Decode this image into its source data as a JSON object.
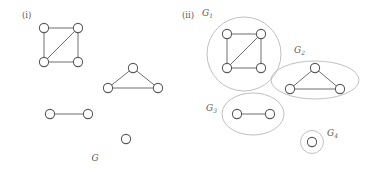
{
  "figure": {
    "caption_left": "G",
    "panels": [
      {
        "id": "panel-i",
        "label": "(i)"
      },
      {
        "id": "panel-ii",
        "label": "(ii)"
      }
    ],
    "component_labels": {
      "g1_base": "G",
      "g1_sub": "1",
      "g2_base": "G",
      "g2_sub": "2",
      "g3_base": "G",
      "g3_sub": "3",
      "g4_base": "G",
      "g4_sub": "4"
    },
    "colors": {
      "node_fill": "#ffffff",
      "node_stroke": "#5a5a5a",
      "edge_stroke": "#6f6f6f",
      "enclosure_stroke": "#b9b9b9",
      "text": "#5a5a5a",
      "background": "#ffffff"
    }
  },
  "graph_left": {
    "name": "G",
    "components": [
      {
        "name": "square-with-diagonal",
        "vertices": [
          {
            "id": "a1",
            "cx": 44,
            "cy": 28,
            "r": 4.6
          },
          {
            "id": "a2",
            "cx": 78,
            "cy": 28,
            "r": 4.6
          },
          {
            "id": "a3",
            "cx": 44,
            "cy": 62,
            "r": 4.6
          },
          {
            "id": "a4",
            "cx": 78,
            "cy": 62,
            "r": 4.6
          }
        ],
        "edges": [
          [
            "a1",
            "a2"
          ],
          [
            "a1",
            "a3"
          ],
          [
            "a2",
            "a4"
          ],
          [
            "a3",
            "a4"
          ],
          [
            "a3",
            "a2"
          ]
        ]
      },
      {
        "name": "triangle",
        "vertices": [
          {
            "id": "b1",
            "cx": 133,
            "cy": 68,
            "r": 4.6
          },
          {
            "id": "b2",
            "cx": 108,
            "cy": 88,
            "r": 4.6
          },
          {
            "id": "b3",
            "cx": 158,
            "cy": 88,
            "r": 4.6
          }
        ],
        "edges": [
          [
            "b1",
            "b2"
          ],
          [
            "b1",
            "b3"
          ],
          [
            "b2",
            "b3"
          ]
        ]
      },
      {
        "name": "single-edge",
        "vertices": [
          {
            "id": "c1",
            "cx": 50,
            "cy": 114,
            "r": 4.6
          },
          {
            "id": "c2",
            "cx": 88,
            "cy": 114,
            "r": 4.6
          }
        ],
        "edges": [
          [
            "c1",
            "c2"
          ]
        ]
      },
      {
        "name": "isolated-vertex",
        "vertices": [
          {
            "id": "d1",
            "cx": 126,
            "cy": 139,
            "r": 4.6
          }
        ],
        "edges": []
      }
    ]
  },
  "graph_right": {
    "components": [
      {
        "name": "G1",
        "enclosure": {
          "shape": "ellipse",
          "cx": 244,
          "cy": 54,
          "rx": 37,
          "ry": 37
        },
        "label_pos": {
          "x": 202,
          "y": 16
        },
        "vertices": [
          {
            "id": "a1",
            "cx": 227,
            "cy": 34,
            "r": 4.6
          },
          {
            "id": "a2",
            "cx": 261,
            "cy": 34,
            "r": 4.6
          },
          {
            "id": "a3",
            "cx": 227,
            "cy": 68,
            "r": 4.6
          },
          {
            "id": "a4",
            "cx": 261,
            "cy": 68,
            "r": 4.6
          }
        ],
        "edges": [
          [
            "a1",
            "a2"
          ],
          [
            "a1",
            "a3"
          ],
          [
            "a2",
            "a4"
          ],
          [
            "a3",
            "a4"
          ],
          [
            "a3",
            "a2"
          ]
        ]
      },
      {
        "name": "G2",
        "enclosure": {
          "shape": "ellipse",
          "cx": 315,
          "cy": 80,
          "rx": 44,
          "ry": 19
        },
        "label_pos": {
          "x": 294,
          "y": 53
        },
        "vertices": [
          {
            "id": "b1",
            "cx": 315,
            "cy": 68,
            "r": 4.6
          },
          {
            "id": "b2",
            "cx": 290,
            "cy": 89,
            "r": 4.6
          },
          {
            "id": "b3",
            "cx": 340,
            "cy": 89,
            "r": 4.6
          }
        ],
        "edges": [
          [
            "b1",
            "b2"
          ],
          [
            "b1",
            "b3"
          ],
          [
            "b2",
            "b3"
          ]
        ]
      },
      {
        "name": "G3",
        "enclosure": {
          "shape": "ellipse",
          "cx": 253,
          "cy": 114,
          "rx": 31,
          "ry": 21
        },
        "label_pos": {
          "x": 206,
          "y": 111
        },
        "vertices": [
          {
            "id": "c1",
            "cx": 237,
            "cy": 114,
            "r": 4.6
          },
          {
            "id": "c2",
            "cx": 270,
            "cy": 114,
            "r": 4.6
          }
        ],
        "edges": [
          [
            "c1",
            "c2"
          ]
        ]
      },
      {
        "name": "G4",
        "enclosure": {
          "shape": "ellipse",
          "cx": 312,
          "cy": 142,
          "rx": 11.5,
          "ry": 11.5
        },
        "label_pos": {
          "x": 327,
          "y": 136
        },
        "vertices": [
          {
            "id": "d1",
            "cx": 312,
            "cy": 142,
            "r": 4.6
          }
        ],
        "edges": []
      }
    ]
  }
}
